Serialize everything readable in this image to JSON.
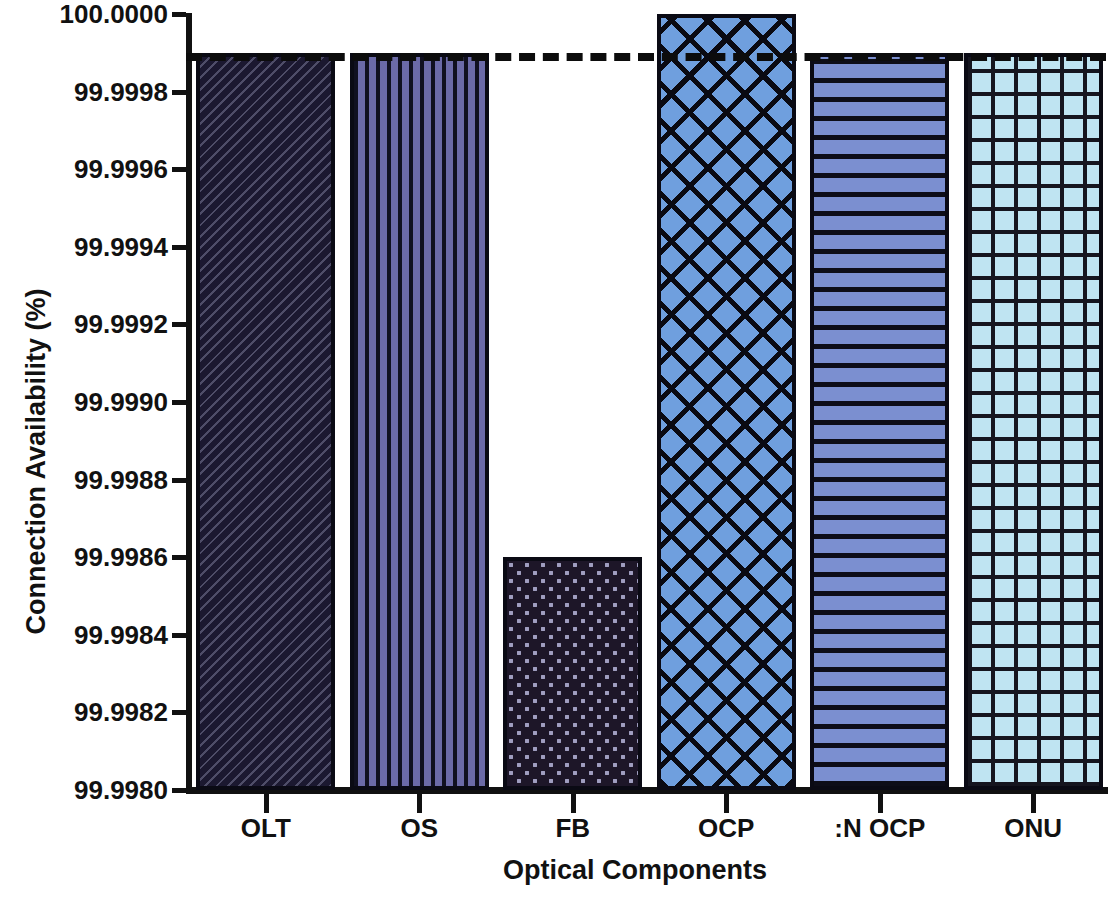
{
  "chart_data": {
    "type": "bar",
    "title": "",
    "xlabel": "Optical Components",
    "ylabel": "Connection Availability (%)",
    "categories": [
      "OLT",
      "OS",
      "FB",
      "OCP",
      ":N OCP",
      "ONU"
    ],
    "values": [
      99.9999,
      99.9999,
      99.9986,
      100.0,
      99.9999,
      99.9999
    ],
    "ylim": [
      99.998,
      100.0
    ],
    "yticks": [
      "100.0000",
      "99.9998",
      "99.9996",
      "99.9994",
      "99.9992",
      "99.9990",
      "99.9988",
      "99.9986",
      "99.9984",
      "99.9982",
      "99.9980"
    ],
    "ytick_values": [
      100.0,
      99.9998,
      99.9996,
      99.9994,
      99.9992,
      99.999,
      99.9988,
      99.9986,
      99.9984,
      99.9982,
      99.998
    ],
    "grid": false,
    "legend": false,
    "reference_line": {
      "value": 99.9999,
      "style": "dashed",
      "color": "#0c0c0c"
    },
    "series": [
      {
        "name": "Connection Availability",
        "bars": [
          {
            "label": "OLT",
            "value": 99.9999,
            "color": "#1b1830",
            "pattern": "diagonal-hatch"
          },
          {
            "label": "OS",
            "value": 99.9999,
            "color": "#6b6aa8",
            "pattern": "vertical-stripes"
          },
          {
            "label": "FB",
            "value": 99.9986,
            "color": "#1d1628",
            "pattern": "dots"
          },
          {
            "label": "OCP",
            "value": 100.0,
            "color": "#6f9fde",
            "pattern": "diagonal-crosshatch"
          },
          {
            "label": ":N OCP",
            "value": 99.9999,
            "color": "#7b8fd0",
            "pattern": "horizontal-stripes"
          },
          {
            "label": "ONU",
            "value": 99.9999,
            "color": "#bfe4f2",
            "pattern": "grid"
          }
        ]
      }
    ]
  }
}
